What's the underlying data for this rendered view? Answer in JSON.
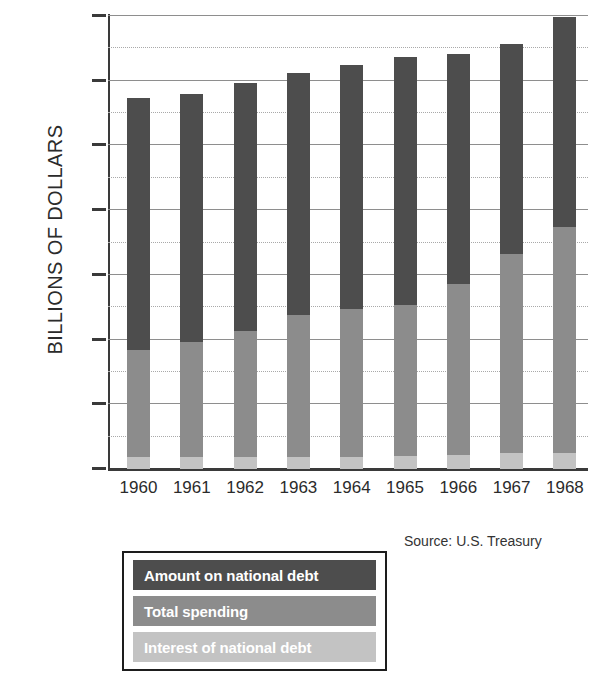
{
  "chart_data": {
    "type": "bar",
    "subtype": "stacked-vertical",
    "title": "",
    "xlabel": "",
    "ylabel": "BILLIONS OF DOLLARS",
    "categories": [
      "1960",
      "1961",
      "1962",
      "1963",
      "1964",
      "1965",
      "1966",
      "1967",
      "1968"
    ],
    "ylim": [
      0,
      350
    ],
    "ytick_labels": [
      "0",
      "50",
      "100",
      "150",
      "200",
      "250",
      "300",
      "350"
    ],
    "ytick_values": [
      0,
      50,
      100,
      150,
      200,
      250,
      300,
      350
    ],
    "minor_gridline_values": [
      25,
      75,
      125,
      175,
      225,
      275,
      325
    ],
    "grid": true,
    "legend_position": "below-left",
    "series": [
      {
        "name": "Interest of national debt",
        "color": "#c3c3c3",
        "values": [
          9,
          9,
          9,
          9,
          9,
          10,
          11,
          12,
          12
        ]
      },
      {
        "name": "Total spending",
        "color": "#8c8c8c",
        "values": [
          83,
          89,
          98,
          110,
          115,
          117,
          132,
          154,
          175
        ]
      },
      {
        "name": "Amount on national debt",
        "color": "#4d4d4d",
        "values": [
          195,
          192,
          191,
          187,
          188,
          191,
          178,
          162,
          162
        ]
      }
    ],
    "cumulative_tops": {
      "interest": [
        9,
        9,
        9,
        9,
        9,
        10,
        11,
        12,
        12
      ],
      "spending": [
        92,
        98,
        107,
        119,
        124,
        127,
        143,
        166,
        187
      ],
      "debt": [
        287,
        290,
        298,
        306,
        312,
        318,
        321,
        328,
        349
      ]
    },
    "annotations": [
      "Source: U.S. Treasury"
    ]
  },
  "axis": {
    "y_title": "BILLIONS OF DOLLARS"
  },
  "legend": {
    "items": [
      {
        "label": "Amount on national debt",
        "color": "#4d4d4d"
      },
      {
        "label": "Total spending",
        "color": "#8c8c8c"
      },
      {
        "label": "Interest of national debt",
        "color": "#c3c3c3"
      }
    ]
  },
  "source": {
    "text": "Source: U.S. Treasury"
  },
  "colors": {
    "debt": "#4d4d4d",
    "spending": "#8c8c8c",
    "interest": "#c3c3c3",
    "axis": "#3a3a3a",
    "gridline_major": "#8e8e8e",
    "gridline_minor": "#a9a9a9",
    "background": "#ffffff"
  }
}
